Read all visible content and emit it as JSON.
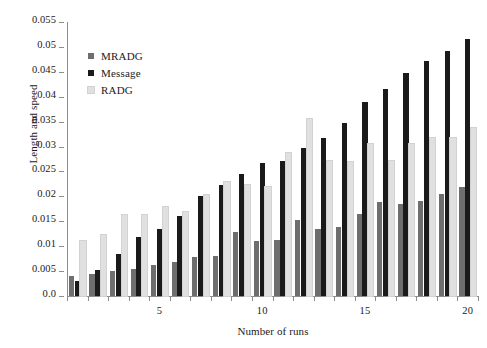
{
  "chart_data": {
    "type": "bar",
    "title": "",
    "xlabel": "Number of runs",
    "ylabel": "Length and speed",
    "categories": [
      1,
      2,
      3,
      4,
      5,
      6,
      7,
      8,
      9,
      10,
      11,
      12,
      13,
      14,
      15,
      16,
      17,
      18,
      19,
      20
    ],
    "xticks": [
      5,
      10,
      15,
      20
    ],
    "yticks": [
      "0.0",
      "0.005",
      "0.01",
      "0.015",
      "0.02",
      "0.025",
      "0.03",
      "0.035",
      "0.04",
      "0.045",
      "0.05",
      "0.055"
    ],
    "ylim": [
      0,
      0.055
    ],
    "ytick_step": 0.005,
    "grid": false,
    "legend_position": "upper-left-inside",
    "series": [
      {
        "name": "MRADG",
        "color": "#6e6e6e",
        "values": [
          0.004,
          0.0045,
          0.005,
          0.0055,
          0.0062,
          0.0068,
          0.0078,
          0.008,
          0.0128,
          0.011,
          0.0113,
          0.0152,
          0.0135,
          0.0138,
          0.0165,
          0.0188,
          0.0185,
          0.019,
          0.0205,
          0.0218
        ]
      },
      {
        "name": "Message",
        "color": "#1a1a1a",
        "values": [
          0.003,
          0.0052,
          0.0085,
          0.0118,
          0.0135,
          0.016,
          0.02,
          0.0222,
          0.0245,
          0.0268,
          0.0272,
          0.0298,
          0.0318,
          0.0348,
          0.039,
          0.0415,
          0.0448,
          0.0472,
          0.0492,
          0.0515
        ]
      },
      {
        "name": "RADG",
        "color": "#e0e0e0",
        "values": [
          0.011,
          0.0122,
          0.0163,
          0.0162,
          0.0178,
          0.0168,
          0.0202,
          0.0228,
          0.0222,
          0.0218,
          0.0288,
          0.0355,
          0.0272,
          0.027,
          0.0305,
          0.0272,
          0.0305,
          0.0318,
          0.0318,
          0.0338
        ]
      }
    ]
  }
}
